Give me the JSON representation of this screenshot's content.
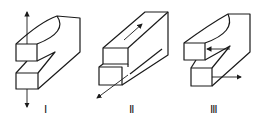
{
  "figure": {
    "stroke_color": "#1a1a1a",
    "background": "#ffffff",
    "panels": [
      {
        "label": "Ⅰ",
        "mode": "opening",
        "arrows": [
          "up",
          "down"
        ]
      },
      {
        "label": "Ⅱ",
        "mode": "sliding",
        "arrows": [
          "diagonal-back",
          "diagonal-forward"
        ]
      },
      {
        "label": "Ⅲ",
        "mode": "tearing",
        "arrows": [
          "left",
          "right"
        ]
      }
    ]
  }
}
